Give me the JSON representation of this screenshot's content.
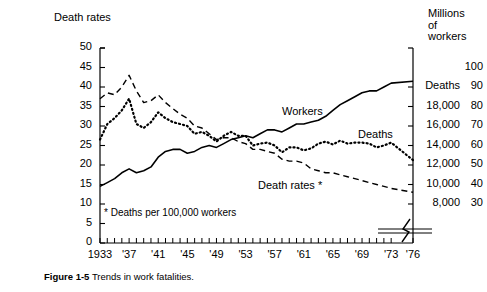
{
  "figure": {
    "caption_label": "Figure 1-5",
    "caption_text": "Trends in work fatalities."
  },
  "chart_data": {
    "type": "line",
    "title": "",
    "subtitle": "",
    "xlabel": "",
    "ylabel": "Death rates",
    "ylabel_right": "Millions of workers",
    "grid": false,
    "legend_position": "inline-annotations",
    "footnote": "* Deaths per 100,000 workers",
    "axis_break_note": "break between '73 and '76",
    "x": [
      1933,
      1934,
      1935,
      1936,
      1937,
      1938,
      1939,
      1940,
      1941,
      1942,
      1943,
      1944,
      1945,
      1946,
      1947,
      1948,
      1949,
      1950,
      1951,
      1952,
      1953,
      1954,
      1955,
      1956,
      1957,
      1958,
      1959,
      1960,
      1961,
      1962,
      1963,
      1964,
      1965,
      1966,
      1967,
      1968,
      1969,
      1970,
      1971,
      1972,
      1973,
      1976
    ],
    "xticks": [
      "1933",
      "'37",
      "'41",
      "'45",
      "'49",
      "'53",
      "'57",
      "'61",
      "'65",
      "'69",
      "'73",
      "'76"
    ],
    "xtick_years": [
      1933,
      1937,
      1941,
      1945,
      1949,
      1953,
      1957,
      1961,
      1965,
      1969,
      1973,
      1976
    ],
    "xlim": [
      1933,
      1976
    ],
    "yticks_left": [
      0,
      5,
      10,
      15,
      20,
      25,
      30,
      35,
      40,
      45,
      50
    ],
    "ylim_left": [
      0,
      50
    ],
    "yticks_right_deaths": [
      "8,000",
      "10,000",
      "12,000",
      "14,000",
      "16,000",
      "18,000",
      "Deaths"
    ],
    "yticks_right_deaths_values": [
      8000,
      10000,
      12000,
      14000,
      16000,
      18000,
      20000
    ],
    "ylim_right_deaths": [
      4000,
      24000
    ],
    "yticks_right_workers": [
      30,
      40,
      50,
      60,
      70,
      80,
      90,
      100
    ],
    "ylim_right_workers": [
      10,
      110
    ],
    "series": [
      {
        "name": "Death rates *",
        "label": "Death rates *",
        "style": "dashed",
        "axis": "left",
        "unit": "deaths per 100,000 workers",
        "values": [
          37.0,
          38.5,
          38.0,
          40.0,
          43.0,
          39.0,
          36.0,
          36.5,
          38.0,
          36.0,
          34.5,
          33.0,
          32.0,
          30.0,
          29.5,
          28.0,
          26.5,
          27.0,
          27.0,
          26.0,
          25.5,
          24.0,
          24.0,
          23.5,
          23.0,
          21.5,
          21.0,
          21.0,
          20.5,
          19.0,
          18.5,
          18.0,
          18.0,
          17.5,
          17.0,
          16.5,
          16.0,
          15.5,
          15.0,
          14.5,
          14.0,
          13.0
        ],
        "label_pos": {
          "x": 258,
          "y": 180
        }
      },
      {
        "name": "Deaths",
        "label": "Deaths",
        "style": "dotted",
        "axis": "right-deaths",
        "unit": "deaths",
        "values": [
          14600,
          16200,
          16800,
          17600,
          18800,
          16200,
          15800,
          16400,
          17400,
          16800,
          16400,
          16200,
          16000,
          15200,
          15400,
          15000,
          14400,
          15000,
          15400,
          15000,
          15000,
          14000,
          14200,
          14300,
          14000,
          13300,
          13800,
          13800,
          13500,
          13700,
          14200,
          14400,
          14100,
          14500,
          14200,
          14300,
          14300,
          14200,
          13800,
          14000,
          14300,
          12500
        ],
        "label_pos": {
          "x": 358,
          "y": 129
        }
      },
      {
        "name": "Workers",
        "label": "Workers",
        "style": "solid",
        "axis": "right-workers",
        "unit": "millions of workers",
        "values": [
          39,
          41,
          43,
          46,
          48,
          46,
          47,
          49,
          54,
          57,
          58,
          58,
          56,
          57,
          59,
          60,
          59,
          61,
          63,
          64,
          65,
          64,
          66,
          68,
          68,
          67,
          69,
          71,
          71,
          72,
          73,
          75,
          78,
          81,
          83,
          85,
          87,
          88,
          88,
          90,
          92,
          93
        ],
        "label_pos": {
          "x": 282,
          "y": 106
        }
      }
    ]
  }
}
